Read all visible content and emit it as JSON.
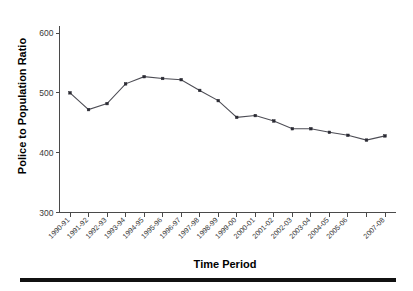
{
  "chart_data": {
    "type": "line",
    "title": "",
    "xlabel": "Time Period",
    "ylabel": "Police to Population Ratio",
    "categories": [
      "1990-91",
      "1991-92",
      "1992-93",
      "1993-94",
      "1994-95",
      "1995-96",
      "1996-97",
      "1997-98",
      "1998-99",
      "1999-00",
      "2000-01",
      "2001-02",
      "2002-03",
      "2003-04",
      "2004-05",
      "2005-06",
      "",
      "2007-08"
    ],
    "values": [
      500,
      472,
      482,
      515,
      527,
      524,
      522,
      504,
      487,
      459,
      462,
      453,
      440,
      440,
      434,
      429,
      421,
      428
    ],
    "series": [
      {
        "name": "Police to Population Ratio",
        "values": [
          500,
          472,
          482,
          515,
          527,
          524,
          522,
          504,
          487,
          459,
          462,
          453,
          440,
          440,
          434,
          429,
          421,
          428
        ]
      }
    ],
    "ylim": [
      300,
      620
    ],
    "yticks": [
      300,
      400,
      500,
      600
    ],
    "ytick_labels": [
      "300",
      "400",
      "500",
      "600"
    ],
    "grid": false,
    "legend": false,
    "marker": "square",
    "line_color": "#4d4d55",
    "marker_color": "#2a2a33",
    "axis_color": "#4a4a4a",
    "tick_count": 18,
    "x_tick_label_rotation": -45,
    "note_missing_label": "2006-07 tick is present but unlabeled"
  },
  "figure": {
    "background_color": "#ffffff",
    "bottom_rule_color": "#111111"
  }
}
